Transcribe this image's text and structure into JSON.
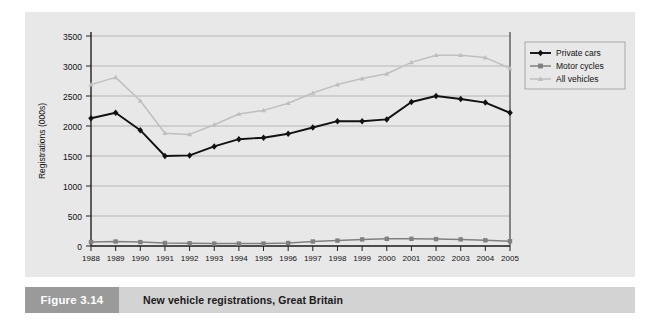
{
  "figure": {
    "number_label": "Figure 3.14",
    "caption": "New vehicle registrations, Great Britain"
  },
  "colors": {
    "panel_background": "#e8e8e8",
    "page_background": "#ffffff",
    "gridline": "#a8a8a8",
    "axis": "#222222",
    "private_cars": "#111111",
    "motor_cycles": "#808080",
    "all_vehicles": "#bfbfbf",
    "caption_block": "#9a9a9a",
    "caption_bar": "#d3d3d3"
  },
  "chart_data": {
    "type": "line",
    "title": "",
    "xlabel": "",
    "ylabel": "Registrations (000s)",
    "ylim": [
      0,
      3500
    ],
    "yticks": [
      0,
      500,
      1000,
      1500,
      2000,
      2500,
      3000,
      3500
    ],
    "ytick_labels": [
      "0",
      "500",
      "1000",
      "1500",
      "2000",
      "2500",
      "3000",
      "3500"
    ],
    "grid": true,
    "legend_position": "right",
    "categories": [
      "1988",
      "1989",
      "1990",
      "1991",
      "1992",
      "1993",
      "1994",
      "1995",
      "1996",
      "1997",
      "1998",
      "1999",
      "2000",
      "2001",
      "2002",
      "2003",
      "2004",
      "2005"
    ],
    "series": [
      {
        "name": "Private cars",
        "color": "#111111",
        "marker": "diamond",
        "values": [
          2130,
          2220,
          1930,
          1500,
          1510,
          1660,
          1780,
          1805,
          1870,
          1975,
          2080,
          2080,
          2110,
          2400,
          2500,
          2450,
          2390,
          2220
        ]
      },
      {
        "name": "Motor cycles",
        "color": "#808080",
        "marker": "square",
        "values": [
          65,
          75,
          65,
          50,
          45,
          40,
          40,
          40,
          50,
          75,
          90,
          110,
          120,
          120,
          115,
          110,
          95,
          80
        ]
      },
      {
        "name": "All vehicles",
        "color": "#bfbfbf",
        "marker": "triangle",
        "values": [
          2690,
          2810,
          2420,
          1880,
          1860,
          2020,
          2200,
          2260,
          2380,
          2550,
          2690,
          2790,
          2870,
          3060,
          3180,
          3180,
          3140,
          2960
        ]
      }
    ]
  },
  "legend": {
    "entries": [
      {
        "label": "Private cars",
        "marker": "diamond",
        "color": "#111111"
      },
      {
        "label": "Motor cycles",
        "marker": "square",
        "color": "#808080"
      },
      {
        "label": "All vehicles",
        "marker": "triangle",
        "color": "#bfbfbf"
      }
    ]
  }
}
